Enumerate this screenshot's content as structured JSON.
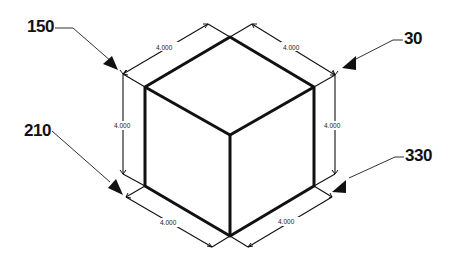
{
  "diagram": {
    "type": "isometric-cube-view-directions",
    "dimensions": {
      "top_left_edge": "4.000",
      "top_right_edge": "4.000",
      "left_vertical_edge": "4.000",
      "right_vertical_edge": "4.000",
      "bottom_left_edge": "4.000",
      "bottom_right_edge": "4.000"
    },
    "view_labels": [
      {
        "id": "upper-left",
        "text": "150"
      },
      {
        "id": "upper-right",
        "text": "30"
      },
      {
        "id": "lower-left",
        "text": "210"
      },
      {
        "id": "lower-right",
        "text": "330"
      }
    ],
    "colors": {
      "line": "#111111",
      "background": "#ffffff"
    }
  }
}
